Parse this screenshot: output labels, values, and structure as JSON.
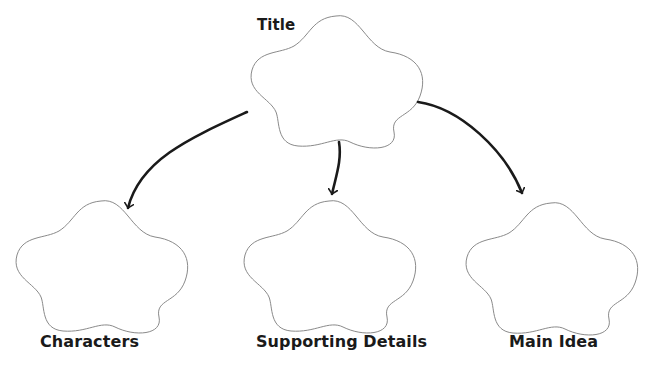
{
  "diagram": {
    "type": "graphic-organizer",
    "colors": {
      "shape_stroke": "#8a8a8a",
      "arrow": "#1a1a1a",
      "text": "#1a1a1a",
      "background": "#ffffff"
    },
    "top_node": {
      "label": "Title",
      "shape": "flower-cloud"
    },
    "children": [
      {
        "label": "Characters",
        "shape": "flower-cloud"
      },
      {
        "label": "Supporting Details",
        "shape": "flower-cloud"
      },
      {
        "label": "Main Idea",
        "shape": "flower-cloud"
      }
    ],
    "edges": [
      {
        "from": "Title",
        "to": "Characters"
      },
      {
        "from": "Title",
        "to": "Supporting Details"
      },
      {
        "from": "Title",
        "to": "Main Idea"
      }
    ]
  }
}
